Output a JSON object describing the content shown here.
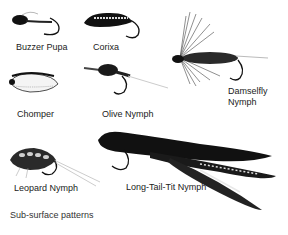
{
  "figure": {
    "caption": "Sub-surface patterns",
    "background": "#ffffff",
    "ink_color": "#1a1a1a",
    "patterns": [
      {
        "name": "Buzzer Pupa"
      },
      {
        "name": "Corixa"
      },
      {
        "name": "Damselfly",
        "name_line2": "Nymph"
      },
      {
        "name": "Chomper"
      },
      {
        "name": "Olive Nymph"
      },
      {
        "name": "Leopard Nymph"
      },
      {
        "name": "Long-Tail-Tit Nymph"
      }
    ]
  }
}
